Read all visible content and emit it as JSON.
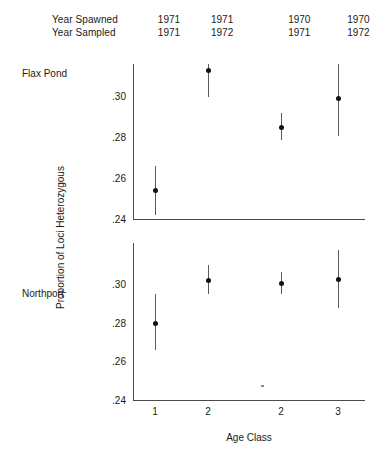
{
  "header": {
    "rows": [
      {
        "label": "Year Spawned",
        "values": [
          "1971",
          "1971",
          "1970",
          "1970"
        ]
      },
      {
        "label": "Year Sampled",
        "values": [
          "1971",
          "1972",
          "1971",
          "1972"
        ]
      }
    ]
  },
  "panels": {
    "top_label": "Flax Pond",
    "bottom_label": "Northport"
  },
  "axis": {
    "ylabel": "Proportion of Loci Heterozygous",
    "xlabel": "Age Class",
    "yticks_top": [
      ".30",
      ".28",
      ".26",
      ".24"
    ],
    "yticks_bottom": [
      ".30",
      ".28",
      ".26",
      ".24"
    ],
    "xticks": [
      "1",
      "2",
      "2",
      "3"
    ]
  },
  "chart_data": {
    "type": "scatter",
    "title": "",
    "xlabel": "Age Class",
    "ylabel": "Proportion of Loci Heterozygous",
    "grid": false,
    "legend": "none",
    "categories": [
      "1",
      "2",
      "2",
      "3"
    ],
    "year_spawned": [
      "1971",
      "1971",
      "1970",
      "1970"
    ],
    "year_sampled": [
      "1971",
      "1972",
      "1971",
      "1972"
    ],
    "panels": [
      {
        "name": "Flax Pond",
        "ylim": [
          0.24,
          0.316
        ],
        "yticks": [
          0.24,
          0.26,
          0.28,
          0.3
        ],
        "points": [
          {
            "x": "1",
            "y": 0.2545,
            "lower": 0.2425,
            "upper": 0.2665
          },
          {
            "x": "2",
            "y": 0.313,
            "lower": 0.3,
            "upper": 0.325
          },
          {
            "x": "2",
            "y": 0.2855,
            "lower": 0.279,
            "upper": 0.292
          },
          {
            "x": "3",
            "y": 0.2995,
            "lower": 0.281,
            "upper": 0.318
          }
        ]
      },
      {
        "name": "Northport",
        "ylim": [
          0.24,
          0.322
        ],
        "yticks": [
          0.24,
          0.26,
          0.28,
          0.3
        ],
        "points": [
          {
            "x": "1",
            "y": 0.2805,
            "lower": 0.2665,
            "upper": 0.2955
          },
          {
            "x": "2",
            "y": 0.303,
            "lower": 0.2955,
            "upper": 0.3105
          },
          {
            "x": "2",
            "y": 0.301,
            "lower": 0.2955,
            "upper": 0.307
          },
          {
            "x": "3",
            "y": 0.3035,
            "lower": 0.2885,
            "upper": 0.3185
          }
        ]
      }
    ]
  }
}
